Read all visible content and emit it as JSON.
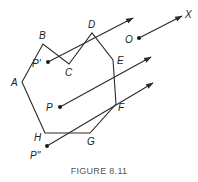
{
  "figure": {
    "caption": "FIGURE 8.11",
    "polygon": {
      "vertices": [
        {
          "name": "A",
          "x": 22,
          "y": 82,
          "label_x": 11,
          "label_y": 86
        },
        {
          "name": "B",
          "x": 43,
          "y": 44,
          "label_x": 39,
          "label_y": 39
        },
        {
          "name": "C",
          "x": 69,
          "y": 64,
          "label_x": 65,
          "label_y": 76
        },
        {
          "name": "D",
          "x": 92,
          "y": 33,
          "label_x": 88,
          "label_y": 28
        },
        {
          "name": "E",
          "x": 113,
          "y": 60,
          "label_x": 117,
          "label_y": 64
        },
        {
          "name": "F",
          "x": 116,
          "y": 104,
          "label_x": 118,
          "label_y": 111
        },
        {
          "name": "G",
          "x": 90,
          "y": 133,
          "label_x": 87,
          "label_y": 145
        },
        {
          "name": "H",
          "x": 45,
          "y": 133,
          "label_x": 34,
          "label_y": 141
        }
      ]
    },
    "points": [
      {
        "name": "O",
        "label": "O",
        "x": 139,
        "y": 38,
        "label_x": 125,
        "label_y": 43,
        "ray_end_x": 182,
        "ray_end_y": 16
      },
      {
        "name": "P-prime",
        "label": "P'",
        "x": 48,
        "y": 62,
        "label_x": 32,
        "label_y": 67,
        "ray_end_x": 133,
        "ray_end_y": 18
      },
      {
        "name": "P",
        "label": "P",
        "x": 60,
        "y": 107,
        "label_x": 46,
        "label_y": 111,
        "ray_end_x": 151,
        "ray_end_y": 57
      },
      {
        "name": "P-double-prime",
        "label": "P''",
        "x": 47,
        "y": 146,
        "label_x": 30,
        "label_y": 159,
        "ray_end_x": 153,
        "ray_end_y": 83
      }
    ],
    "ray_label": {
      "text": "X",
      "x": 185,
      "y": 18
    }
  }
}
